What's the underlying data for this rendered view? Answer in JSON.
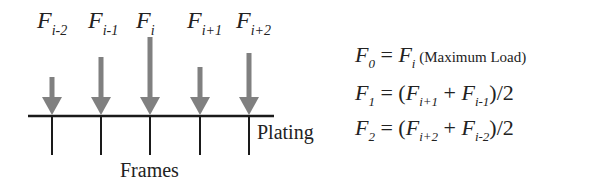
{
  "diagram": {
    "loads": [
      {
        "label_main": "F",
        "label_sub": "i-2",
        "x": 52,
        "shaft_top": 77
      },
      {
        "label_main": "F",
        "label_sub": "i-1",
        "x": 101,
        "shaft_top": 57
      },
      {
        "label_main": "F",
        "label_sub": "i",
        "x": 150,
        "shaft_top": 37
      },
      {
        "label_main": "F",
        "label_sub": "i+1",
        "x": 200,
        "shaft_top": 67
      },
      {
        "label_main": "F",
        "label_sub": "i+2",
        "x": 249,
        "shaft_top": 53
      }
    ],
    "arrow_color": "#808080",
    "line_color": "#1a1a1a",
    "plating_label": "Plating",
    "frames_label": "Frames"
  },
  "equations": [
    {
      "lhs_main": "F",
      "lhs_sub": "0",
      "rhs_parts": [
        {
          "main": "F",
          "sub": "i"
        }
      ],
      "rhs_prefix": "= ",
      "rhs_suffix": "",
      "note": " (Maximum Load)"
    },
    {
      "lhs_main": "F",
      "lhs_sub": "1",
      "rhs_prefix": "= (",
      "a_main": "F",
      "a_sub": "i+1",
      "op": " + ",
      "b_main": "F",
      "b_sub": "i-1",
      "rhs_suffix": ")/2"
    },
    {
      "lhs_main": "F",
      "lhs_sub": "2",
      "rhs_prefix": "= (",
      "a_main": "F",
      "a_sub": "i+2",
      "op": " + ",
      "b_main": "F",
      "b_sub": "i-2",
      "rhs_suffix": ")/2"
    }
  ]
}
